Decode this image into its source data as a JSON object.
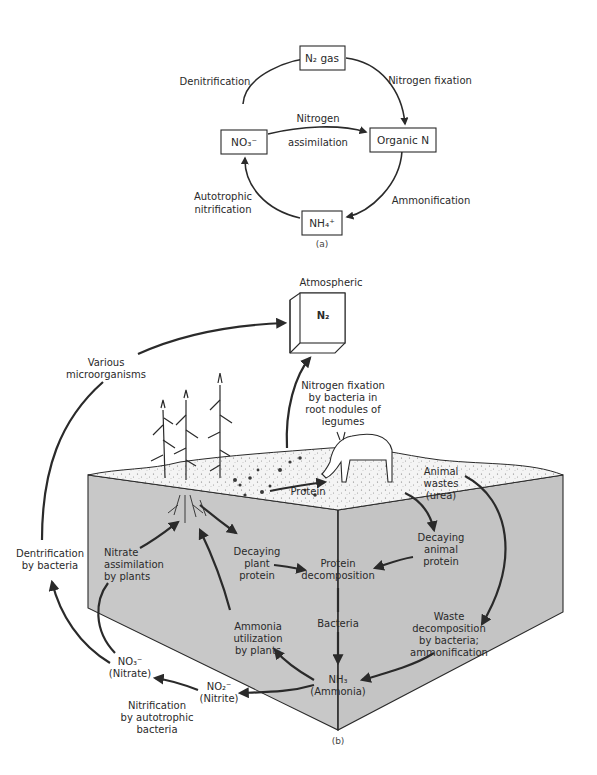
{
  "figure_a": {
    "caption": "(a)",
    "nodes": {
      "n2": {
        "label": "N₂ gas"
      },
      "organic": {
        "label": "Organic N"
      },
      "nh4": {
        "label": "NH₄⁺"
      },
      "no3": {
        "label": "NO₃⁻"
      }
    },
    "edges": {
      "denitrification": "Denitrification",
      "fixation": "Nitrogen fixation",
      "assimilation_1": "Nitrogen",
      "assimilation_2": "assimilation",
      "ammonification": "Ammonification",
      "nitrification_1": "Autotrophic",
      "nitrification_2": "nitrification"
    }
  },
  "figure_b": {
    "caption": "(b)",
    "atmospheric_label": "Atmospheric",
    "n2_label": "N₂",
    "labels": {
      "microorganisms": [
        "Various",
        "microorganisms"
      ],
      "fixation": [
        "Nitrogen fixation",
        "by bacteria in",
        "root nodules of",
        "legumes"
      ],
      "denitrification": [
        "Dentrification",
        "by bacteria"
      ],
      "nitrate_assim": [
        "Nitrate",
        "assimilation",
        "by plants"
      ],
      "decaying_plant": [
        "Decaying",
        "plant",
        "protein"
      ],
      "protein": "Protein",
      "protein_decomp": [
        "Protein",
        "decomposition"
      ],
      "animal_wastes": [
        "Animal",
        "wastes",
        "(urea)"
      ],
      "decaying_animal": [
        "Decaying",
        "animal",
        "protein"
      ],
      "bacteria": "Bacteria",
      "waste_decomp": [
        "Waste",
        "decomposition",
        "by bacteria;",
        "ammonification"
      ],
      "ammonia_util": [
        "Ammonia",
        "utilization",
        "by plants"
      ],
      "nh3": [
        "NH₃",
        "(Ammonia)"
      ],
      "no3": [
        "NO₃⁻",
        "(Nitrate)"
      ],
      "no2": [
        "NO₂⁻",
        "(Nitrite)"
      ],
      "nitrification": [
        "Nitrification",
        "by autotrophic",
        "bacteria"
      ]
    },
    "colors": {
      "soil": "#c8c8c8",
      "surface": "#f4f4f4",
      "ink": "#2a2a2a"
    }
  }
}
